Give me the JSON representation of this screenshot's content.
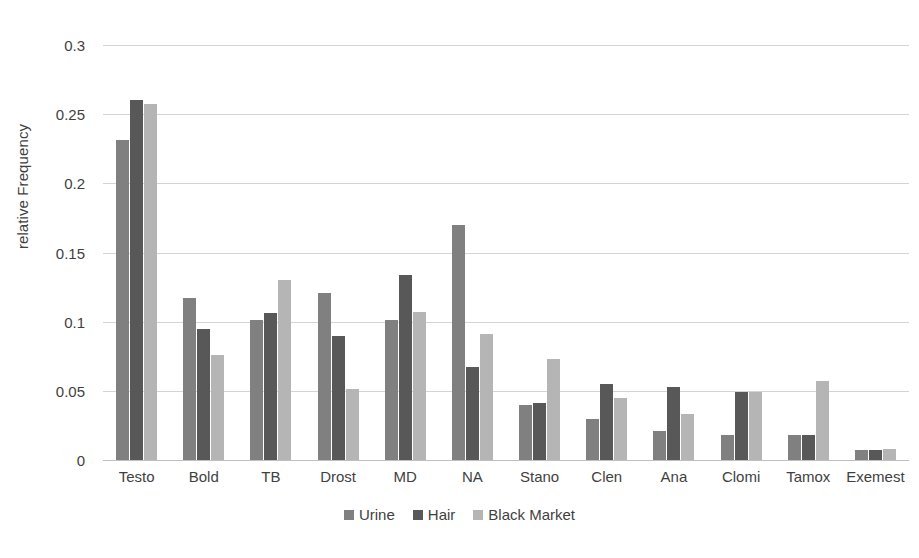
{
  "chart_data": {
    "type": "bar",
    "title": "",
    "subtitle": "",
    "xlabel": "",
    "ylabel": "relative Frequency",
    "ylim": [
      0,
      0.3
    ],
    "yticks": [
      "0",
      "0.05",
      "0.1",
      "0.15",
      "0.2",
      "0.25",
      "0.3"
    ],
    "ytick_values": [
      0,
      0.05,
      0.1,
      0.15,
      0.2,
      0.25,
      0.3
    ],
    "grid": true,
    "legend_position": "bottom",
    "categories": [
      "Testo",
      "Bold",
      "TB",
      "Drost",
      "MD",
      "NA",
      "Stano",
      "Clen",
      "Ana",
      "Clomi",
      "Tamox",
      "Exemest"
    ],
    "series": [
      {
        "name": "Urine",
        "color": "#808080",
        "values": [
          0.231,
          0.117,
          0.101,
          0.121,
          0.101,
          0.17,
          0.04,
          0.03,
          0.021,
          0.018,
          0.018,
          0.007
        ]
      },
      {
        "name": "Hair",
        "color": "#585858",
        "values": [
          0.26,
          0.095,
          0.106,
          0.09,
          0.134,
          0.067,
          0.041,
          0.055,
          0.053,
          0.049,
          0.018,
          0.007
        ]
      },
      {
        "name": "Black Market",
        "color": "#b5b5b5",
        "values": [
          0.257,
          0.076,
          0.13,
          0.051,
          0.107,
          0.091,
          0.073,
          0.045,
          0.033,
          0.049,
          0.057,
          0.008
        ]
      }
    ]
  }
}
